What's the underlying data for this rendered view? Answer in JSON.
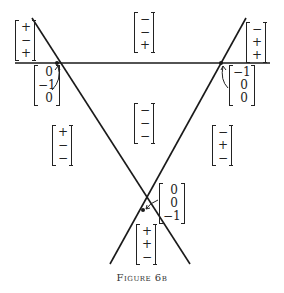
{
  "figure": {
    "caption": "Figure 6b",
    "lines": [
      {
        "name": "horizontal-line",
        "x1": 15,
        "y1": 63,
        "x2": 270,
        "y2": 63
      },
      {
        "name": "left-diagonal-line",
        "x1": 32,
        "y1": 18,
        "x2": 190,
        "y2": 264
      },
      {
        "name": "right-diagonal-line",
        "x1": 246,
        "y1": 18,
        "x2": 110,
        "y2": 264
      }
    ],
    "intersections": [
      {
        "name": "left-intersection",
        "x": 57,
        "y": 63
      },
      {
        "name": "right-intersection",
        "x": 221,
        "y": 63
      },
      {
        "name": "bottom-intersection",
        "x": 143,
        "y": 210
      }
    ],
    "region_vectors": [
      {
        "name": "top-left-region",
        "x": 15,
        "y": 20,
        "values": [
          "+",
          "−",
          "+"
        ]
      },
      {
        "name": "top-center-region",
        "x": 134,
        "y": 12,
        "values": [
          "−",
          "−",
          "+"
        ]
      },
      {
        "name": "top-right-region",
        "x": 246,
        "y": 22,
        "values": [
          "−",
          "+",
          "+"
        ]
      },
      {
        "name": "left-region",
        "x": 52,
        "y": 125,
        "values": [
          "+",
          "−",
          "−"
        ]
      },
      {
        "name": "center-region",
        "x": 134,
        "y": 103,
        "values": [
          "−",
          "−",
          "−"
        ]
      },
      {
        "name": "right-region",
        "x": 212,
        "y": 125,
        "values": [
          "−",
          "+",
          "−"
        ]
      },
      {
        "name": "bottom-region",
        "x": 136,
        "y": 224,
        "values": [
          "+",
          "+",
          "−"
        ]
      }
    ],
    "vertex_vectors": [
      {
        "name": "left-vertex-vector",
        "x": 34,
        "y": 65,
        "values": [
          "0",
          "−1",
          "0"
        ]
      },
      {
        "name": "right-vertex-vector",
        "x": 229,
        "y": 65,
        "values": [
          "−1",
          "0",
          "0"
        ]
      },
      {
        "name": "bottom-vertex-vector",
        "x": 159,
        "y": 183,
        "values": [
          "0",
          "0",
          "−1"
        ]
      }
    ]
  }
}
